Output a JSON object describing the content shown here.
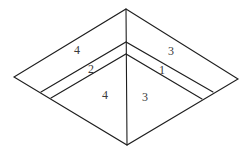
{
  "diagram": {
    "labels": {
      "top_left_region": "4",
      "top_right_region": "3",
      "band_left": "2",
      "band_right": "1",
      "bottom_left_region": "4",
      "bottom_right_region": "3"
    },
    "colors": {
      "stroke": "#1e1e1e",
      "text": "#3a3a3a",
      "background": "#ffffff"
    }
  }
}
